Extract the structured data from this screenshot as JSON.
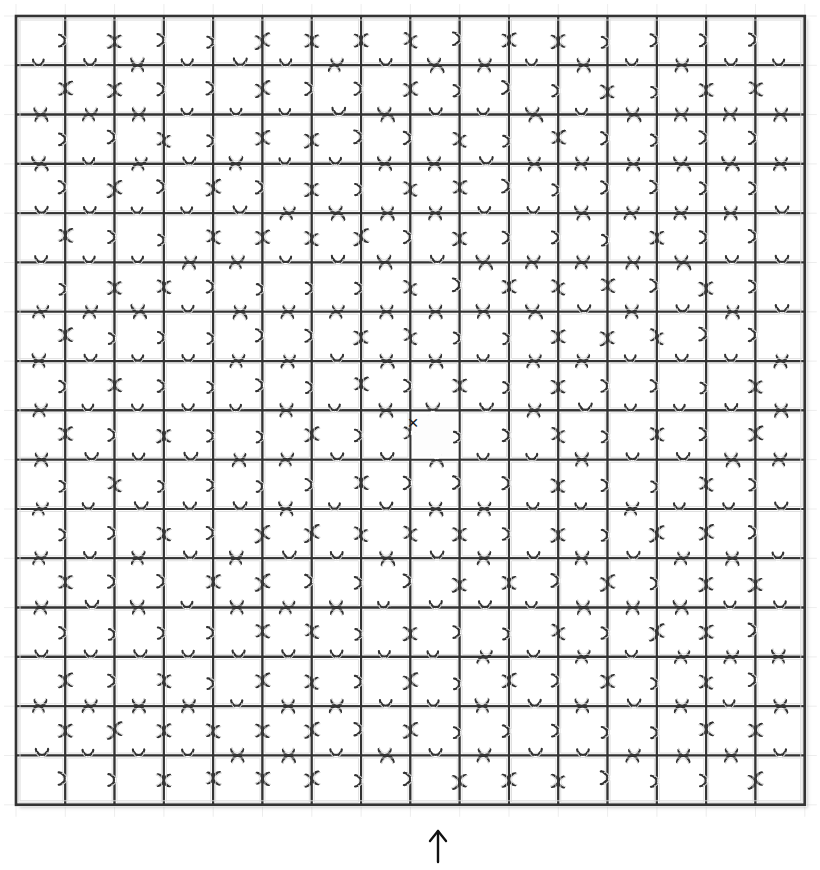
{
  "scene": {
    "title": "Jigsaw Puzzle Grid",
    "background_color": "#ffffff",
    "width": 820,
    "height": 870
  },
  "puzzle": {
    "name": "jigsaw-puzzle-board",
    "columns": 16,
    "rows": 16,
    "total_pieces": 256,
    "placed_pieces": 255,
    "missing_pieces": 1,
    "origin_x": 16,
    "origin_y": 16,
    "piece_size": 49.3,
    "board_width": 789,
    "board_height": 789,
    "stroke_color": "#333333",
    "inner_stroke_color": "#d8d8d8",
    "fill_color": "#ffffff",
    "stroke_width": 2.1,
    "inner_stroke_width": 0.9,
    "tab_radius_ratio": 0.115,
    "neck_ratio": 0.055,
    "border_stroke_width": 2.6,
    "shadow_color": "rgba(120,120,120,0.35)"
  },
  "missing_slot": {
    "name": "missing-piece-slot",
    "column": 8,
    "row": 8,
    "center_x": 413,
    "center_y": 422,
    "marker": "×",
    "marker_size": 19,
    "marker_color": "#1a1a1a",
    "slot_fill": "#fdfdfd",
    "label": "Missing piece location"
  },
  "pointer": {
    "name": "bottom-arrow-pointer",
    "glyph": "↑",
    "tip_x": 438,
    "tip_y": 831,
    "tail_y": 862,
    "color": "#111111",
    "stroke_width": 2.4,
    "head_size": 8,
    "target_column": 8,
    "description": "Arrow pointing up at the bottom edge of the puzzle"
  },
  "gridlines": {
    "name": "faint-gridlines",
    "color": "#e9e9e9",
    "stroke_width": 0.8,
    "tick_extension": 12,
    "visible": true
  }
}
